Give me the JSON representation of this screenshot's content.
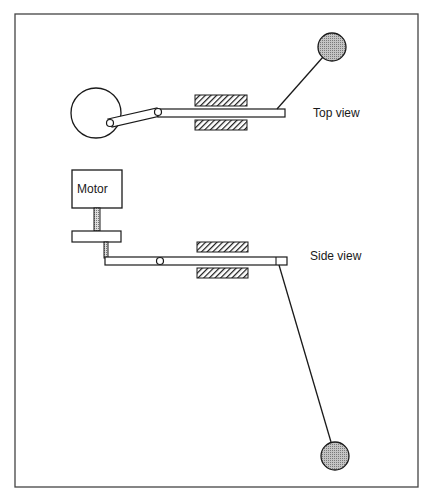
{
  "diagram": {
    "labels": {
      "top_view": "Top view",
      "side_view": "Side view",
      "motor": "Motor"
    },
    "colors": {
      "stroke": "#1a1a1a",
      "frame": "#444444",
      "ball_fill": "#a8a8a8",
      "hatch": "#1a1a1a",
      "background": "#ffffff"
    },
    "views": [
      {
        "name": "top",
        "components": [
          "drive-wheel",
          "crank-link",
          "slider-rod",
          "bearing-upper",
          "bearing-lower",
          "pendulum-arm",
          "pendulum-ball"
        ]
      },
      {
        "name": "side",
        "components": [
          "motor",
          "motor-shaft",
          "drive-disc",
          "crank-pin-shaft",
          "slider-rod",
          "bearing-upper",
          "bearing-lower",
          "pendulum-arm",
          "pendulum-ball"
        ]
      }
    ]
  }
}
